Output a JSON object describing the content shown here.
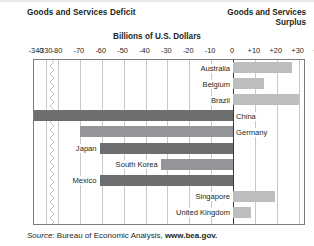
{
  "header": {
    "deficit_title": "Goods and Services Deficit",
    "surplus_title_line1": "Goods and Services",
    "surplus_title_line2": "Surplus",
    "units_title": "Billions of U.S. Dollars"
  },
  "source": {
    "prefix": "Source:",
    "agency": "Bureau of Economic Analysis,",
    "url": "www.bea.gov."
  },
  "colors": {
    "deficit_bar": "#6d6e70",
    "deficit_bar_light": "#939598",
    "surplus_bar": "#bcbdbf",
    "gridline": "#c8c8c8",
    "zeroline": "#3a3a3a",
    "plot_border": "#7a7a7a",
    "text": "#231f20"
  },
  "axis": {
    "tick_labels": [
      "-340",
      "-330",
      "-80",
      "-70",
      "-60",
      "-50",
      "-40",
      "-30",
      "-20",
      "-10",
      "0",
      "+10",
      "+20",
      "+30",
      "+40"
    ],
    "tick_values": [
      -340,
      -330,
      -80,
      -70,
      -60,
      -50,
      -40,
      -30,
      -20,
      -10,
      0,
      10,
      20,
      30,
      40
    ],
    "has_axis_break": true,
    "break_between": [
      -330,
      -80
    ],
    "zero_value": 0
  },
  "chart_data": {
    "type": "bar",
    "orientation": "horizontal",
    "title": "Billions of U.S. Dollars",
    "xlabel": "Billions of U.S. Dollars",
    "ylabel": "",
    "xlim": [
      -340,
      40
    ],
    "grid": true,
    "legend": "none",
    "annotations": [
      "Goods and Services Deficit",
      "Goods and Services Surplus"
    ],
    "categories": [
      "Australia",
      "Belgium",
      "Brazil",
      "China",
      "Germany",
      "Japan",
      "South Korea",
      "Mexico",
      "Singapore",
      "United Kingdom"
    ],
    "values": [
      27,
      14,
      30,
      -340,
      -70,
      -61,
      -33,
      -61,
      19,
      8
    ],
    "series": [
      {
        "name": "Goods and Services Balance",
        "values": [
          27,
          14,
          30,
          -340,
          -70,
          -61,
          -33,
          -61,
          19,
          8
        ]
      }
    ],
    "bars": [
      {
        "label": "Australia",
        "value": 27,
        "sign": "surplus",
        "label_side": "left"
      },
      {
        "label": "Belgium",
        "value": 14,
        "sign": "surplus",
        "label_side": "left"
      },
      {
        "label": "Brazil",
        "value": 30,
        "sign": "surplus",
        "label_side": "left"
      },
      {
        "label": "China",
        "value": -340,
        "sign": "deficit",
        "label_side": "right"
      },
      {
        "label": "Germany",
        "value": -70,
        "sign": "deficit",
        "label_side": "right"
      },
      {
        "label": "Japan",
        "value": -61,
        "sign": "deficit",
        "label_side": "left"
      },
      {
        "label": "South Korea",
        "value": -33,
        "sign": "deficit",
        "label_side": "left"
      },
      {
        "label": "Mexico",
        "value": -61,
        "sign": "deficit",
        "label_side": "left"
      },
      {
        "label": "Singapore",
        "value": 19,
        "sign": "surplus",
        "label_side": "left"
      },
      {
        "label": "United Kingdom",
        "value": 8,
        "sign": "surplus",
        "label_side": "left"
      }
    ]
  }
}
